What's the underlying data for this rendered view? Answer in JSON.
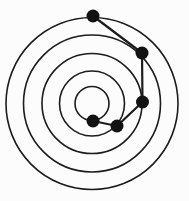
{
  "canvas": {
    "width": 189,
    "height": 201,
    "background": "#fcfcfc"
  },
  "diagram": {
    "type": "concentric-circles-path",
    "center": {
      "x": 92,
      "y": 103.5
    },
    "ring_radii": [
      17,
      32.5,
      50,
      68.5,
      86
    ],
    "ring_stroke_color": "#1c1c1c",
    "ring_stroke_width": 1.6,
    "nodes": [
      {
        "x": 93,
        "y": 16,
        "ring": 5
      },
      {
        "x": 142,
        "y": 53,
        "ring": 4
      },
      {
        "x": 142.5,
        "y": 102,
        "ring": 3
      },
      {
        "x": 117,
        "y": 126,
        "ring": 2
      },
      {
        "x": 93,
        "y": 121,
        "ring": 1
      }
    ],
    "node_radius": 6.5,
    "node_fill_color": "#121212",
    "edges": [
      [
        0,
        1
      ],
      [
        1,
        2
      ],
      [
        2,
        3
      ],
      [
        3,
        4
      ]
    ],
    "edge_stroke_color": "#1c1c1c",
    "edge_stroke_width": 2.2
  }
}
